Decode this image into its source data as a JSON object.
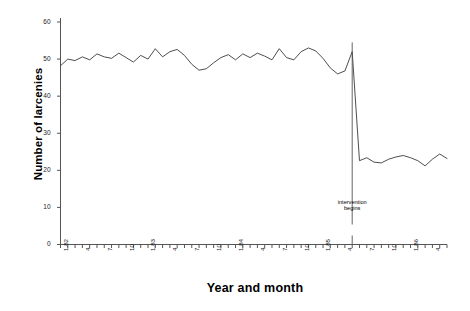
{
  "chart_data": {
    "type": "line",
    "title": "",
    "xlabel": "Year and month",
    "ylabel": "Number of larcenies",
    "ylim": [
      0,
      60
    ],
    "yticks": [
      0,
      10,
      20,
      30,
      40,
      50,
      60
    ],
    "grid": false,
    "legend": null,
    "x": [
      "1.82",
      "2.82",
      "3.82",
      "4.82",
      "5.82",
      "6.82",
      "7.82",
      "8.82",
      "9.82",
      "10.82",
      "11.82",
      "12.82",
      "1.83",
      "2.83",
      "3.83",
      "4.83",
      "5.83",
      "6.83",
      "7.83",
      "8.83",
      "9.83",
      "10.83",
      "11.83",
      "12.83",
      "1.84",
      "2.84",
      "3.84",
      "4.84",
      "5.84",
      "6.84",
      "7.84",
      "8.84",
      "9.84",
      "10.84",
      "11.84",
      "12.84",
      "1.85",
      "2.85",
      "3.85",
      "4.85",
      "5.85",
      "6.85",
      "7.85",
      "8.85",
      "9.85",
      "10.85",
      "11.85",
      "12.85",
      "1.86",
      "2.86",
      "3.86",
      "4.86",
      "5.86",
      "6.86"
    ],
    "xtick_labels": [
      {
        "label": "1.82",
        "index": 0
      },
      {
        "label": "4",
        "index": 3
      },
      {
        "label": "7",
        "index": 6
      },
      {
        "label": "10",
        "index": 9
      },
      {
        "label": "1.83",
        "index": 12
      },
      {
        "label": "4",
        "index": 15
      },
      {
        "label": "7",
        "index": 18
      },
      {
        "label": "10",
        "index": 21
      },
      {
        "label": "1.84",
        "index": 24
      },
      {
        "label": "4",
        "index": 27
      },
      {
        "label": "7",
        "index": 30
      },
      {
        "label": "10",
        "index": 33
      },
      {
        "label": "1.85",
        "index": 36
      },
      {
        "label": "4",
        "index": 39
      },
      {
        "label": "7",
        "index": 42
      },
      {
        "label": "10",
        "index": 45
      },
      {
        "label": "1.86",
        "index": 48
      },
      {
        "label": "4",
        "index": 51
      }
    ],
    "values": [
      48.2,
      50.0,
      49.6,
      50.6,
      49.8,
      51.4,
      50.6,
      50.2,
      51.6,
      50.4,
      49.2,
      51.0,
      50.0,
      52.8,
      50.6,
      52.0,
      52.6,
      51.0,
      48.6,
      47.0,
      47.4,
      49.0,
      50.4,
      51.2,
      49.8,
      51.4,
      50.4,
      51.6,
      50.8,
      49.8,
      52.8,
      50.4,
      49.8,
      52.0,
      53.0,
      52.2,
      50.2,
      47.6,
      46.0,
      46.8,
      52.0,
      22.6,
      23.4,
      22.2,
      22.0,
      23.0,
      23.6,
      24.0,
      23.4,
      22.6,
      21.2,
      23.0,
      24.4,
      23.2
    ],
    "intervention": {
      "label_line1": "intervention",
      "label_line2": "begins",
      "at_index": 40,
      "marker": "vertical-line"
    },
    "line_color": "#3a3a3a",
    "axis_color": "#555555"
  }
}
